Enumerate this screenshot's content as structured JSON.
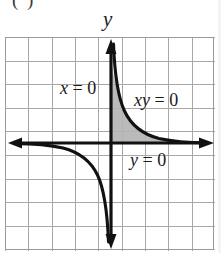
{
  "figure": {
    "label": "( )",
    "label_extra": "",
    "axis_labels": {
      "y": "y"
    },
    "annotations": {
      "x_equals_zero": "x = 0",
      "xy_equals_zero": "xy = 0",
      "y_equals_zero": "y = 0"
    },
    "colors": {
      "grid": "#9a9a9a",
      "axis": "#111111",
      "curve": "#111111",
      "shade": "#b4b4b4",
      "background": "#ffffff"
    }
  },
  "chart_data": {
    "type": "line",
    "title": "",
    "subtitle": "",
    "xlabel": "",
    "ylabel": "y",
    "xlim": [
      -4.6,
      4.6
    ],
    "ylim": [
      -4.5,
      4.5
    ],
    "grid": true,
    "legend": null,
    "grid_spacing": 1,
    "origin_px": [
      110,
      143
    ],
    "unit_px": 23.4,
    "series": [
      {
        "name": "xy = 1 (branch I)",
        "quadrant": 1,
        "equation": "y = 1/x",
        "x": [
          0.22,
          0.25,
          0.3,
          0.4,
          0.5,
          0.6,
          0.8,
          1.0,
          1.25,
          1.5,
          2.0,
          2.5,
          3.0,
          3.5,
          4.0,
          4.5
        ],
        "y": [
          4.55,
          4.0,
          3.33,
          2.5,
          2.0,
          1.67,
          1.25,
          1.0,
          0.8,
          0.67,
          0.5,
          0.4,
          0.33,
          0.29,
          0.25,
          0.22
        ]
      },
      {
        "name": "xy = 1 (branch III)",
        "quadrant": 3,
        "equation": "y = 1/x",
        "x": [
          -4.5,
          -4.0,
          -3.5,
          -3.0,
          -2.5,
          -2.0,
          -1.5,
          -1.25,
          -1.0,
          -0.8,
          -0.6,
          -0.5,
          -0.4,
          -0.3,
          -0.25,
          -0.22
        ],
        "y": [
          -0.22,
          -0.25,
          -0.29,
          -0.33,
          -0.4,
          -0.5,
          -0.67,
          -0.8,
          -1.0,
          -1.25,
          -1.67,
          -2.0,
          -2.5,
          -3.33,
          -4.0,
          -4.55
        ]
      }
    ],
    "shaded_region": {
      "label": "xy = 0",
      "description": "region bounded by x-axis, y-axis and the first-quadrant branch",
      "color": "#b4b4b4"
    },
    "annotations": [
      {
        "text": "x = 0",
        "x": -2.1,
        "y": 2.4
      },
      {
        "text": "xy = 0",
        "x": 1.1,
        "y": 1.9
      },
      {
        "text": "y = 0",
        "x": 0.9,
        "y": -0.6
      },
      {
        "text": "y",
        "x": 0.0,
        "y": 5.1
      }
    ],
    "axis_arrows": [
      "left",
      "right",
      "up",
      "down"
    ]
  }
}
